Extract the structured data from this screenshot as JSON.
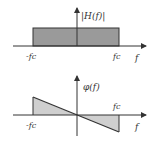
{
  "top_plot": {
    "y_label": "|H(f)|",
    "x_label": "f",
    "neg_cutoff": "-fc",
    "pos_cutoff": "fc",
    "fill_color": "#9a9a9a"
  },
  "bottom_plot": {
    "y_label": "φ(f)",
    "x_label": "f",
    "neg_cutoff": "-fc",
    "pos_cutoff": "fc",
    "fill_color": "#cfcfcf"
  }
}
